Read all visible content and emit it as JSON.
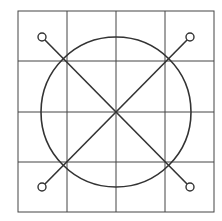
{
  "diagram": {
    "stroke_color": "#333333",
    "background": "#ffffff",
    "grid": {
      "x0": 18,
      "y0": 11,
      "x1": 214,
      "y1": 212,
      "cols": 4,
      "rows": 4,
      "x_lines": [
        67,
        116,
        165
      ],
      "y_lines": [
        61,
        112,
        162
      ]
    },
    "circle": {
      "cx": 116,
      "cy": 112,
      "r": 75
    },
    "diagonals": [
      {
        "x1": 42,
        "y1": 37,
        "x2": 190,
        "y2": 187
      },
      {
        "x1": 190,
        "y1": 37,
        "x2": 42,
        "y2": 187
      }
    ],
    "endpoints": [
      {
        "cx": 42,
        "cy": 37,
        "r": 4
      },
      {
        "cx": 190,
        "cy": 37,
        "r": 4
      },
      {
        "cx": 42,
        "cy": 187,
        "r": 4
      },
      {
        "cx": 190,
        "cy": 187,
        "r": 4
      }
    ]
  }
}
